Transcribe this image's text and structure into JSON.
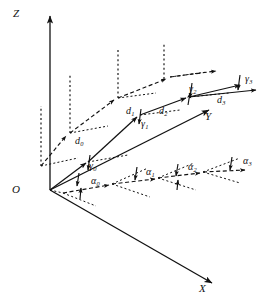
{
  "figure": {
    "type": "3d-coordinate-diagram",
    "width": 271,
    "height": 305,
    "background_color": "#ffffff",
    "stroke_color": "#111111"
  },
  "axes": {
    "z": {
      "label": "Z",
      "x": 13,
      "y": 14,
      "origin": [
        50,
        190
      ],
      "tip": [
        50,
        12
      ]
    },
    "x": {
      "label": "X",
      "x": 199,
      "y": 288,
      "origin": [
        50,
        190
      ],
      "tip": [
        216,
        284
      ]
    },
    "y": {
      "label": "Y",
      "x": 205,
      "y": 116,
      "origin": [
        50,
        190
      ],
      "tip": [
        213,
        107
      ]
    },
    "origin": {
      "label": "O",
      "x": 13,
      "y": 189
    }
  },
  "segments": {
    "d": [
      {
        "label": "d",
        "sub": "0",
        "x": 75,
        "y": 141
      },
      {
        "label": "d",
        "sub": "1",
        "x": 126,
        "y": 111
      },
      {
        "label": "d",
        "sub": "2",
        "x": 159,
        "y": 110
      },
      {
        "label": "d",
        "sub": "3",
        "x": 217,
        "y": 99
      }
    ]
  },
  "elevation_angles": {
    "name": "gamma",
    "glyph": "γ",
    "items": [
      {
        "label": "γ",
        "sub": "0",
        "x": 89,
        "y": 166
      },
      {
        "label": "γ",
        "sub": "1",
        "x": 139,
        "y": 124
      },
      {
        "label": "γ",
        "sub": "2",
        "x": 189,
        "y": 89
      },
      {
        "label": "γ",
        "sub": "3",
        "x": 245,
        "y": 79
      }
    ]
  },
  "azimuth_angles": {
    "name": "alpha",
    "glyph": "α",
    "items": [
      {
        "label": "α",
        "sub": "0",
        "x": 91,
        "y": 181
      },
      {
        "label": "α",
        "sub": "1",
        "x": 146,
        "y": 172
      },
      {
        "label": "α",
        "sub": "2",
        "x": 188,
        "y": 167
      },
      {
        "label": "α",
        "sub": "3",
        "x": 243,
        "y": 161
      }
    ]
  },
  "paths": {
    "trajectory_solid": {
      "style": "solid",
      "points": [
        [
          50,
          190
        ],
        [
          88,
          162
        ],
        [
          140,
          115
        ],
        [
          189,
          97
        ],
        [
          243,
          84
        ]
      ]
    },
    "projection_upper_dashed": {
      "style": "dashed",
      "points": [
        [
          41,
          165
        ],
        [
          70,
          133
        ],
        [
          118,
          98
        ],
        [
          170,
          77
        ],
        [
          222,
          70
        ]
      ]
    },
    "projection_ground_dashed": {
      "style": "dashed",
      "points": [
        [
          65,
          192
        ],
        [
          112,
          183
        ],
        [
          158,
          177
        ],
        [
          203,
          171
        ],
        [
          248,
          168
        ]
      ]
    }
  }
}
